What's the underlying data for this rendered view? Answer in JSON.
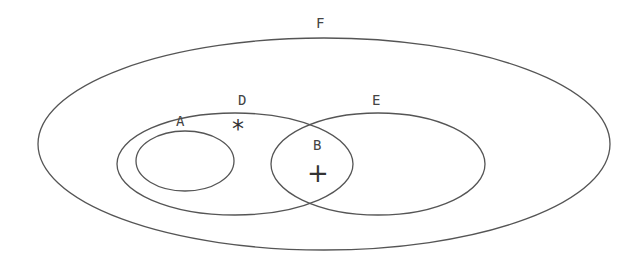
{
  "diagram": {
    "type": "venn",
    "stroke_color": "#555555",
    "background": "#ffffff",
    "sets": [
      {
        "id": "F",
        "label": "F",
        "cx": 324,
        "cy": 144,
        "rx": 286,
        "ry": 106,
        "label_x": 316,
        "label_y": 28
      },
      {
        "id": "D",
        "label": "D",
        "cx": 235,
        "cy": 164,
        "rx": 118,
        "ry": 51,
        "label_x": 238,
        "label_y": 105
      },
      {
        "id": "E",
        "label": "E",
        "cx": 378,
        "cy": 164,
        "rx": 107,
        "ry": 51,
        "label_x": 372,
        "label_y": 105
      },
      {
        "id": "A",
        "label": "A",
        "cx": 185,
        "cy": 161,
        "rx": 49,
        "ry": 30,
        "label_x": 176,
        "label_y": 126
      }
    ],
    "region_labels": [
      {
        "id": "B",
        "label": "B",
        "x": 313,
        "y": 150,
        "description": "intersection of D and E"
      }
    ],
    "markers": [
      {
        "id": "asterisk",
        "symbol": "*",
        "x": 239,
        "y": 137,
        "region": "D only (outside A)"
      },
      {
        "id": "plus",
        "symbol": "+",
        "x": 316,
        "y": 182,
        "region": "B (D ∩ E)"
      }
    ]
  }
}
